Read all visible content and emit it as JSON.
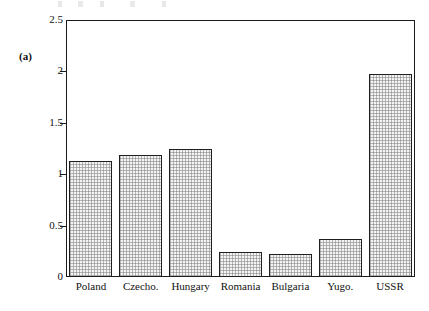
{
  "figure": {
    "panel_label": "(a)"
  },
  "chart_data": {
    "type": "bar",
    "title": "",
    "subtitle": "",
    "xlabel": "",
    "ylabel": "",
    "categories": [
      "Poland",
      "Czecho.",
      "Hungary",
      "Romania",
      "Bulgaria",
      "Yugo.",
      "USSR"
    ],
    "values": [
      1.13,
      1.19,
      1.25,
      0.24,
      0.22,
      0.37,
      1.97
    ],
    "series": [
      {
        "name": "",
        "values": [
          1.13,
          1.19,
          1.25,
          0.24,
          0.22,
          0.37,
          1.97
        ]
      }
    ],
    "ylim": [
      0,
      2.5
    ],
    "y_ticks": [
      0,
      0.5,
      1,
      1.5,
      2,
      2.5
    ],
    "y_tick_labels": [
      "0",
      "0.5",
      "1",
      "1.5",
      "2",
      "2.5"
    ],
    "grid": false,
    "legend": null,
    "legend_position": "none",
    "annotations": [
      "(a)"
    ],
    "bar_fill_color": "#f0f0f0",
    "bar_edge_color": "#1f1f1f",
    "axis_color": "#1a1a1a",
    "background_color": "#ffffff"
  }
}
